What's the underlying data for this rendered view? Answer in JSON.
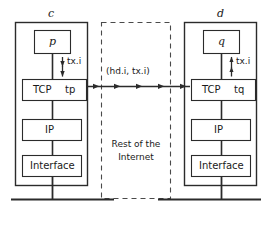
{
  "figure": {
    "background": "#ffffff",
    "stroke_color": "#2b2b2b",
    "text_color": "#1a1a1a"
  },
  "hosts": [
    {
      "id": "c",
      "name": "c",
      "side": "left",
      "process": "p",
      "transport_layer": "TCP",
      "transport_port": "tp",
      "network_layer": "IP",
      "link_layer": "Interface",
      "arrow_label": "tx.i",
      "arrow_direction": "down"
    },
    {
      "id": "d",
      "name": "d",
      "side": "right",
      "process": "q",
      "transport_layer": "TCP",
      "transport_port": "tq",
      "network_layer": "IP",
      "link_layer": "Interface",
      "arrow_label": "tx.i",
      "arrow_direction": "up"
    }
  ],
  "network": {
    "cloud_label_line1": "Rest of the",
    "cloud_label_line2": "Internet",
    "segment_label": "(hd.i, tx.i)",
    "arrow_count": 5,
    "arrow_direction": "left-to-right"
  }
}
